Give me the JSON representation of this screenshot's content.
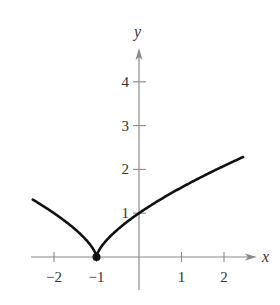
{
  "chart_data": {
    "type": "line",
    "title": "",
    "xlabel": "x",
    "ylabel": "y",
    "function": "y = (x + 1)^(2/3)",
    "xlim": [
      -2.5,
      2.7
    ],
    "ylim": [
      0,
      4.6
    ],
    "grid": false,
    "x_ticks": [
      -2,
      -1,
      1,
      2
    ],
    "x_tick_labels": [
      "−2",
      "−1",
      "1",
      "2"
    ],
    "y_ticks": [
      1,
      2,
      3,
      4
    ],
    "y_tick_labels": [
      "1",
      "2",
      "3",
      "4"
    ],
    "series": [
      {
        "name": "f(x)",
        "x": [
          -2.5,
          -2.25,
          -2.0,
          -1.75,
          -1.5,
          -1.25,
          -1.0,
          -0.75,
          -0.5,
          -0.25,
          0.0,
          0.5,
          1.0,
          1.5,
          2.0,
          2.45
        ],
        "y": [
          1.31,
          1.16,
          1.0,
          0.83,
          0.63,
          0.4,
          0.0,
          0.4,
          0.63,
          0.83,
          1.0,
          1.31,
          1.59,
          1.84,
          2.08,
          2.28
        ]
      }
    ],
    "annotations": [
      {
        "type": "point",
        "x": -1,
        "y": 0,
        "style": "filled-dot"
      }
    ]
  },
  "axes": {
    "x_label": "x",
    "y_label": "y"
  },
  "colors": {
    "axis": "#8a8a8a",
    "curve": "#111111",
    "text": "#333333"
  }
}
